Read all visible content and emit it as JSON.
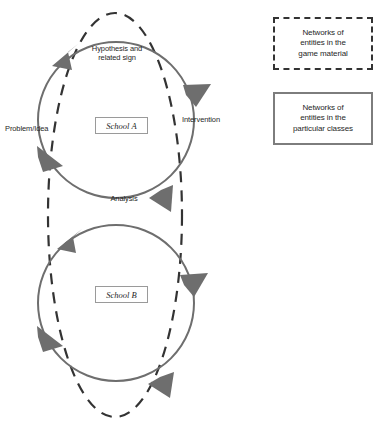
{
  "diagram": {
    "colors": {
      "solid_circle_stroke": "#6e6e6e",
      "dashed_ellipse_stroke": "#333333",
      "arrow_fill": "#6e6e6e",
      "legend_dashed_border": "#333333",
      "legend_solid_border": "#7d7d7d",
      "text": "#1f1f1f",
      "background": "#ffffff"
    },
    "cycle_labels": [
      {
        "id": "hypothesis",
        "text": "Hypothesis and\nrelated sign"
      },
      {
        "id": "intervention",
        "text": "Intervention"
      },
      {
        "id": "analysis",
        "text": "Analysis"
      },
      {
        "id": "problem-idea",
        "text": "Problem/Idea"
      }
    ],
    "nodes": [
      {
        "id": "school-a",
        "label": "School A"
      },
      {
        "id": "school-b",
        "label": "School B"
      }
    ],
    "legend": [
      {
        "id": "game-material",
        "style": "dashed",
        "text": "Networks of\nentities in the\ngame material"
      },
      {
        "id": "particular-classes",
        "style": "solid",
        "text": "Networks of\nentities in the\nparticular classes"
      }
    ]
  }
}
